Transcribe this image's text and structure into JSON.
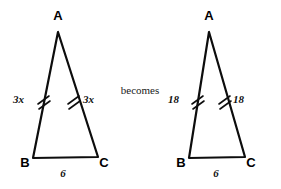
{
  "figure": {
    "connector": "becomes",
    "stroke_color": "#0d0d0d",
    "background_color": "#ffffff",
    "left_triangle": {
      "name": "triangle-ABC-variable",
      "vertices": {
        "apex": "A",
        "bottom_left": "B",
        "bottom_right": "C"
      },
      "left_leg_label": "3x",
      "right_leg_label": "3x",
      "base_label": "6",
      "tick_count": 2
    },
    "right_triangle": {
      "name": "triangle-ABC-numeric",
      "vertices": {
        "apex": "A",
        "bottom_left": "B",
        "bottom_right": "C"
      },
      "left_leg_label": "18",
      "right_leg_label": "18",
      "base_label": "6",
      "tick_count": 2
    }
  }
}
